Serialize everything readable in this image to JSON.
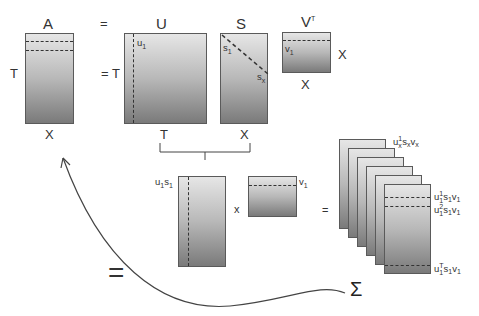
{
  "title_row": {
    "a_label": "A",
    "eq1": "=",
    "u_label": "U",
    "s_label": "S",
    "vt_label": "V",
    "vt_sup": "T"
  },
  "matrix_a": {
    "row_label": "T",
    "col_label": "X"
  },
  "matrix_u": {
    "row_label": "= T",
    "col_label": "T",
    "column_label": "u",
    "column_sub": "1"
  },
  "matrix_s": {
    "col_label": "X",
    "diag_start": "s",
    "diag_start_sub": "1",
    "diag_end": "s",
    "diag_end_sub": "x"
  },
  "matrix_vt": {
    "row_label": "X",
    "col_label": "X",
    "row_name": "v",
    "row_sub": "1"
  },
  "product_row": {
    "u1s1_label": "u",
    "u1s1_sub1": "1",
    "u1s1_s": "s",
    "u1s1_sub2": "1",
    "times": "x",
    "v1_label": "v",
    "v1_sub": "1",
    "equals": "="
  },
  "stack": {
    "top_label": {
      "u": "u",
      "sup": "1",
      "sub": "x",
      "s": "s",
      "s_sub": "x",
      "v": "v",
      "v_sub": "x"
    },
    "rows": [
      {
        "u": "u",
        "sup": "1",
        "sub": "1",
        "s": "s",
        "s_sub": "1",
        "v": "v",
        "v_sub": "1"
      },
      {
        "u": "u",
        "sup": "2",
        "sub": "1",
        "s": "s",
        "s_sub": "1",
        "v": "v",
        "v_sub": "1"
      },
      {
        "u": "u",
        "sup": "T",
        "sub": "1",
        "s": "s",
        "s_sub": "1",
        "v": "v",
        "v_sub": "1"
      }
    ],
    "frame_count": 6
  },
  "bottom": {
    "big_equals": "=",
    "sigma": "Σ"
  },
  "colors": {
    "line": "#333333",
    "border": "#5a5a5a",
    "grad_top": "#e6e6e6",
    "grad_bottom": "#7a7a7a"
  }
}
